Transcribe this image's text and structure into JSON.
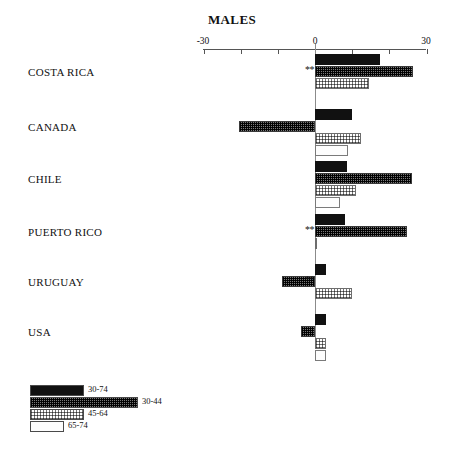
{
  "chart_data": {
    "type": "bar",
    "orientation": "horizontal",
    "title": "MALES",
    "xlabel": "",
    "ylabel": "",
    "xlim": [
      -30,
      30
    ],
    "xticks": [
      -30,
      -20,
      -10,
      0,
      10,
      20,
      30
    ],
    "xtick_labels": [
      "-30",
      "",
      "",
      "0",
      "",
      "",
      "30"
    ],
    "grid": false,
    "legend_position": "bottom-left",
    "categories": [
      "COSTA RICA",
      "CANADA",
      "CHILE",
      "PUERTO RICO",
      "URUGUAY",
      "USA"
    ],
    "series": [
      {
        "name": "30-74",
        "values": [
          17.5,
          10.0,
          8.5,
          8.0,
          3.0,
          3.0
        ]
      },
      {
        "name": "30-44",
        "values": [
          26.5,
          -20.4,
          26.0,
          24.7,
          -9.0,
          -3.8
        ]
      },
      {
        "name": "45-64",
        "values": [
          14.5,
          12.5,
          11.0,
          0.5,
          10.0,
          3.0
        ]
      },
      {
        "name": "65-74",
        "values": [
          0.0,
          9.0,
          6.8,
          0.0,
          0.0,
          3.0
        ]
      }
    ],
    "annotations": [
      {
        "category": "COSTA RICA",
        "text": "**"
      },
      {
        "category": "PUERTO RICO",
        "text": "**"
      },
      {
        "category": "URUGUAY",
        "text": "**"
      }
    ]
  },
  "axis": {
    "left_label": "-30",
    "zero_label": "0",
    "right_label": "30"
  },
  "legend": {
    "items": [
      {
        "label": "30-74",
        "fill": "solid",
        "width": 54
      },
      {
        "label": "30-44",
        "fill": "dark-hatch",
        "width": 108
      },
      {
        "label": "45-64",
        "fill": "light-hatch",
        "width": 54
      },
      {
        "label": "65-74",
        "fill": "empty",
        "width": 34
      }
    ]
  },
  "footer": {
    "mark": ""
  }
}
